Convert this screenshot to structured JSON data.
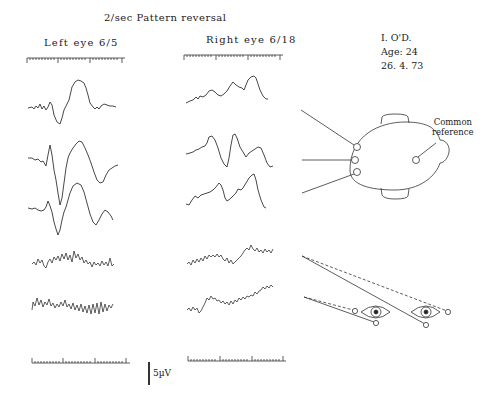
{
  "figure": {
    "title": "2/sec Pattern reversal",
    "left_column": {
      "heading": "Left eye 6/5"
    },
    "right_column": {
      "heading": "Right eye 6/18"
    },
    "patient_info": {
      "name": "I. O'D.",
      "age": "Age: 24",
      "date": "26. 4. 73"
    },
    "head_diagram": {
      "label_line1": "Common",
      "label_line2": "reference",
      "electrodes": [
        "upper-occipital",
        "mid-occipital",
        "lower-occipital",
        "common-reference"
      ]
    },
    "eye_diagram": {
      "eyes": [
        "left-eye",
        "right-eye"
      ]
    },
    "scale_bar": {
      "label": "5µV"
    },
    "traces_per_column": 5
  }
}
